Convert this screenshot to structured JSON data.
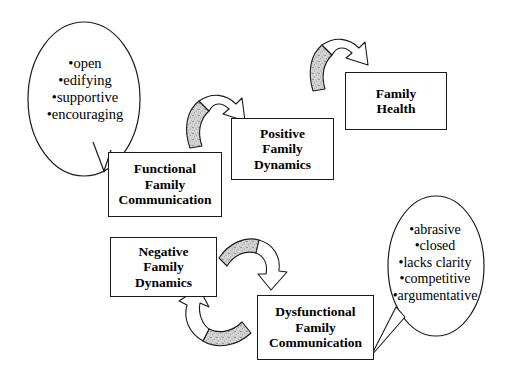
{
  "diagram": {
    "boxes": [
      {
        "id": "functional",
        "lines": [
          "Functional",
          "Family",
          "Communication"
        ]
      },
      {
        "id": "positive",
        "lines": [
          "Positive",
          "Family",
          "Dynamics"
        ]
      },
      {
        "id": "health",
        "lines": [
          "Family",
          "Health"
        ]
      },
      {
        "id": "negative",
        "lines": [
          "Negative",
          "Family",
          "Dynamics"
        ]
      },
      {
        "id": "dysfunctional",
        "lines": [
          "Dysfunctional",
          "Family",
          "Communication"
        ]
      }
    ],
    "callouts": [
      {
        "id": "functional-traits",
        "attached_to": "functional",
        "items": [
          "•open",
          "•edifying",
          "•supportive",
          "•encouraging"
        ]
      },
      {
        "id": "dysfunctional-traits",
        "attached_to": "dysfunctional",
        "items": [
          "•abrasive",
          "•closed",
          "•lacks clarity",
          "•competitive",
          "•argumentative"
        ]
      }
    ],
    "arrows": [
      {
        "id": "functional-to-positive",
        "from": "functional",
        "to": "positive",
        "direction": "up-right"
      },
      {
        "id": "positive-to-health",
        "from": "positive",
        "to": "health",
        "direction": "up-right"
      },
      {
        "id": "negative-to-dysfunctional",
        "from": "negative",
        "to": "dysfunctional",
        "direction": "down-right"
      },
      {
        "id": "dysfunctional-to-negative",
        "from": "dysfunctional",
        "to": "negative",
        "direction": "up-left"
      }
    ],
    "colors": {
      "stroke": "#1a1a1a",
      "background": "#ffffff",
      "arrow_fill": "#ffffff",
      "arrow_shade": "#b4b4b4",
      "text": "#000000"
    }
  }
}
